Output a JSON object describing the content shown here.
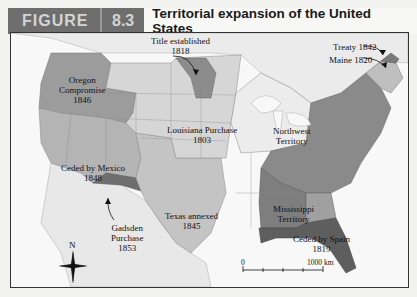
{
  "header": {
    "figure_label": "FIGURE",
    "figure_number": "8.3",
    "title": "Territorial expansion of the United States"
  },
  "map": {
    "labels": {
      "oregon": {
        "name": "Oregon",
        "name2": "Compromise",
        "year": "1846"
      },
      "title_established": {
        "name": "Title established",
        "year": "1818"
      },
      "louisiana": {
        "name": "Louisiana Purchase",
        "year": "1803"
      },
      "northwest": {
        "name": "Northwest",
        "name2": "Territory"
      },
      "treaty": {
        "name": "Treaty 1842"
      },
      "maine": {
        "name": "Maine 1820"
      },
      "mexico": {
        "name": "Ceded by Mexico",
        "year": "1848"
      },
      "texas": {
        "name": "Texas annexed",
        "year": "1845"
      },
      "mississippi": {
        "name": "Mississippi",
        "name2": "Territory"
      },
      "gadsden": {
        "name": "Gadsden",
        "name2": "Purchase",
        "year": "1853"
      },
      "spain": {
        "name": "Ceded by Spain",
        "year": "1819"
      }
    },
    "compass": {
      "north": "N"
    },
    "scale": {
      "start": "0",
      "end": "1000 km"
    },
    "colors": {
      "original_states": "#8a8a8a",
      "louisiana": "#d6d6d6",
      "oregon": "#9c9c9c",
      "mexico": "#b4b4b4",
      "texas": "#c4c4c4",
      "gadsden": "#6e6e6e",
      "florida": "#5e5e5e",
      "mississippi": "#7e7e7e",
      "northwest": "#ececec",
      "ocean": "#f8f8f8",
      "foreign_land": "#e6e6e6"
    }
  }
}
